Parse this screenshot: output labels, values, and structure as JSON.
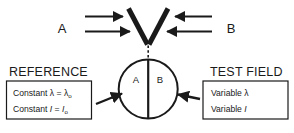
{
  "diagram": {
    "beams": {
      "left_label": "A",
      "right_label": "B"
    },
    "field": {
      "left_half_label": "A",
      "right_half_label": "B"
    },
    "reference": {
      "heading": "REFERENCE",
      "line1_prefix": "Constant ",
      "line1_symbol": "λ",
      "line1_equals": " = ",
      "line1_value_base": "λ",
      "line1_value_sub": "o",
      "line2_prefix": "Constant ",
      "line2_symbol": "I",
      "line2_equals": " = ",
      "line2_value_base": "I",
      "line2_value_sub": "o"
    },
    "test_field": {
      "heading": "TEST FIELD",
      "line1_prefix": "Variable  ",
      "line1_symbol": "λ",
      "line2_prefix": "Variable  ",
      "line2_symbol": "I"
    },
    "colors": {
      "ink": "#1a1a1a",
      "background": "#ffffff"
    }
  }
}
